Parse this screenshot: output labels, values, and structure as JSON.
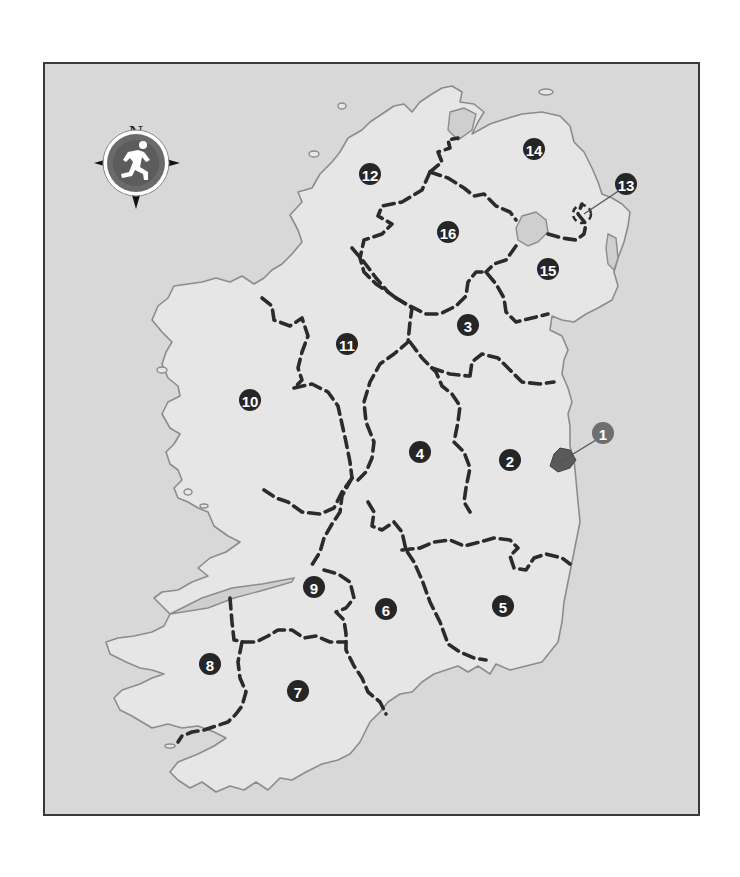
{
  "map": {
    "title": "Ireland regions map",
    "colors": {
      "sea": "#d8d8d8",
      "land": "#e6e6e6",
      "coastline": "#8c8c8c",
      "border": "#2b2b2b",
      "marker": "#262626",
      "marker_highlight": "#6e6e6e"
    },
    "compass": {
      "north_label": "N",
      "icon": "running-figure-compass-icon"
    },
    "markers": [
      {
        "label": "1",
        "x": 601,
        "y": 431,
        "highlight": true
      },
      {
        "label": "2",
        "x": 508,
        "y": 458
      },
      {
        "label": "3",
        "x": 466,
        "y": 323
      },
      {
        "label": "4",
        "x": 418,
        "y": 450
      },
      {
        "label": "5",
        "x": 501,
        "y": 604
      },
      {
        "label": "6",
        "x": 384,
        "y": 607
      },
      {
        "label": "7",
        "x": 296,
        "y": 689
      },
      {
        "label": "8",
        "x": 208,
        "y": 662
      },
      {
        "label": "9",
        "x": 312,
        "y": 585
      },
      {
        "label": "10",
        "x": 248,
        "y": 398
      },
      {
        "label": "11",
        "x": 345,
        "y": 342
      },
      {
        "label": "12",
        "x": 368,
        "y": 172
      },
      {
        "label": "13",
        "x": 624,
        "y": 182
      },
      {
        "label": "14",
        "x": 532,
        "y": 147
      },
      {
        "label": "15",
        "x": 546,
        "y": 267
      },
      {
        "label": "16",
        "x": 446,
        "y": 230
      }
    ]
  }
}
